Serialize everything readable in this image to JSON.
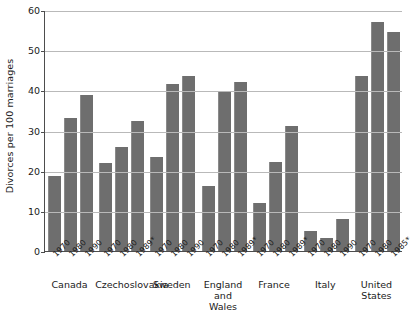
{
  "chart_data": {
    "type": "bar",
    "title": "",
    "xlabel": "",
    "ylabel": "Divorces per 100 marriages",
    "ylim": [
      0,
      60
    ],
    "yticks": [
      0,
      10,
      20,
      30,
      40,
      50,
      60
    ],
    "grid": true,
    "legend": "none",
    "orientation": "vertical",
    "bar_color": "#6e6e6e",
    "groups": [
      {
        "name": "Canada",
        "label": "Canada",
        "points": [
          {
            "year": "1970",
            "value": 18.6
          },
          {
            "year": "1980",
            "value": 33.0
          },
          {
            "year": "1990",
            "value": 38.8
          }
        ]
      },
      {
        "name": "Czechoslovakia",
        "label": "Czechoslovakia",
        "points": [
          {
            "year": "1970",
            "value": 22.0
          },
          {
            "year": "1980",
            "value": 26.0
          },
          {
            "year": "1989*",
            "value": 32.3
          }
        ]
      },
      {
        "name": "Sweden",
        "label": "Sweden",
        "points": [
          {
            "year": "1970",
            "value": 23.4
          },
          {
            "year": "1980",
            "value": 41.5
          },
          {
            "year": "1990",
            "value": 43.5
          }
        ]
      },
      {
        "name": "England and Wales",
        "label": "England\nand\nWales",
        "points": [
          {
            "year": "1970",
            "value": 16.3
          },
          {
            "year": "1980",
            "value": 39.5
          },
          {
            "year": "1989*",
            "value": 42.0
          }
        ]
      },
      {
        "name": "France",
        "label": "France",
        "points": [
          {
            "year": "1970",
            "value": 12.0
          },
          {
            "year": "1980",
            "value": 22.2
          },
          {
            "year": "1989*",
            "value": 31.0
          }
        ]
      },
      {
        "name": "Italy",
        "label": "Italy",
        "points": [
          {
            "year": "1970",
            "value": 5.0
          },
          {
            "year": "1980",
            "value": 3.2
          },
          {
            "year": "1990",
            "value": 8.0
          }
        ]
      },
      {
        "name": "United States",
        "label": "United States",
        "points": [
          {
            "year": "1970",
            "value": 43.5
          },
          {
            "year": "1980",
            "value": 57.0
          },
          {
            "year": "1985*",
            "value": 54.5
          }
        ]
      }
    ]
  }
}
